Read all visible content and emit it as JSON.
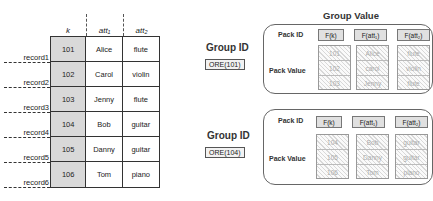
{
  "table": {
    "columns": [
      "k",
      "att₁",
      "att₂"
    ],
    "records": [
      {
        "label": "record1",
        "k": "101",
        "att1": "Alice",
        "att2": "flute"
      },
      {
        "label": "record2",
        "k": "102",
        "att1": "Carol",
        "att2": "violin"
      },
      {
        "label": "record3",
        "k": "103",
        "att1": "Jenny",
        "att2": "flute"
      },
      {
        "label": "record4",
        "k": "104",
        "att1": "Bob",
        "att2": "guitar"
      },
      {
        "label": "record5",
        "k": "105",
        "att1": "Danny",
        "att2": "guitar"
      },
      {
        "label": "record6",
        "k": "106",
        "att1": "Tom",
        "att2": "piano"
      }
    ]
  },
  "group_value_title": "Group Value",
  "groups": [
    {
      "group_id_label": "Group ID",
      "group_id": "ORE(101)",
      "pack_id_label": "Pack ID",
      "pack_value_label": "Pack Value",
      "pack_ids": [
        "F(k)",
        "F(att₁)",
        "F(att₂)"
      ],
      "pack_values": [
        [
          "101",
          "102",
          "103"
        ],
        [
          "Alice",
          "carol",
          "Jenny"
        ],
        [
          "flute",
          "violin",
          "flute"
        ]
      ]
    },
    {
      "group_id_label": "Group ID",
      "group_id": "ORE(104)",
      "pack_id_label": "Pack ID",
      "pack_value_label": "Pack Value",
      "pack_ids": [
        "F(k)",
        "F(att₁)",
        "F(att₂)"
      ],
      "pack_values": [
        [
          "104",
          "105",
          "106"
        ],
        [
          "Bob",
          "Danny",
          "Tom"
        ],
        [
          "guitar",
          "guitar",
          "piano"
        ]
      ]
    }
  ]
}
